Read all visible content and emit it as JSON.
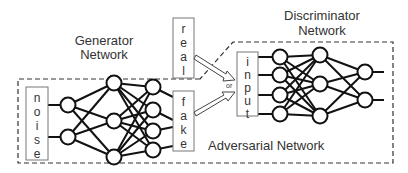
{
  "title_generator": [
    "Generator",
    "Network"
  ],
  "title_discriminator": [
    "Discriminator",
    "Network"
  ],
  "title_adversarial": "Adversarial Network",
  "boxes": {
    "noise": "noise",
    "real": "real",
    "fake": "fake",
    "input": "input"
  },
  "or_label": "or",
  "generator_layers": [
    2,
    3,
    4
  ],
  "discriminator_layers": [
    4,
    3,
    2
  ]
}
